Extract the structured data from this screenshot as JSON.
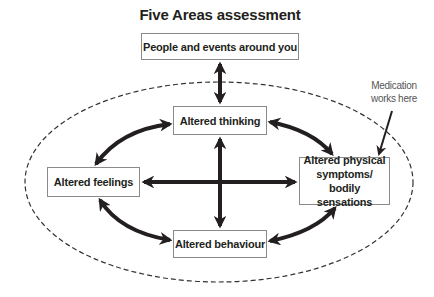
{
  "title": "Five Areas assessment",
  "boxes": {
    "environment": "People and events around you",
    "thinking": "Altered thinking",
    "feelings": "Altered feelings",
    "physical_line1": "Altered physical",
    "physical_line2": "symptoms/ bodily",
    "physical_line3": "sensations",
    "behaviour": "Altered behaviour"
  },
  "annotation": {
    "line1": "Medication",
    "line2": "works here"
  },
  "colors": {
    "arrow": "#231f20",
    "box_border": "#8a8a8a",
    "ellipse": "#333333"
  }
}
